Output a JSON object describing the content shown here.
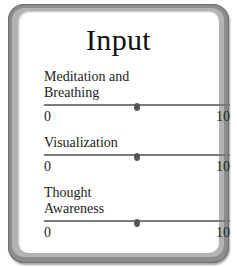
{
  "panel": {
    "title": "Input"
  },
  "sliders": [
    {
      "label": "Meditation and Breathing",
      "label_lines": [
        "Meditation and",
        "Breathing"
      ],
      "min": "0",
      "max": "10",
      "value": 5
    },
    {
      "label": "Visualization",
      "label_lines": [
        "Visualization"
      ],
      "min": "0",
      "max": "10",
      "value": 5
    },
    {
      "label": "Thought Awareness",
      "label_lines": [
        "Thought",
        "Awareness"
      ],
      "min": "0",
      "max": "10",
      "value": 5
    }
  ],
  "colors": {
    "frame_outer": "#8c8c8c",
    "frame_inner": "#b3b3b3",
    "panel_bg": "#ffffff",
    "track": "#7a7a7a",
    "thumb": "#555555",
    "text": "#222222"
  }
}
